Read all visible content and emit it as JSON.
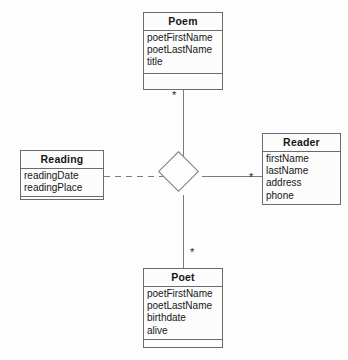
{
  "diagram": {
    "type": "uml-class-diagram",
    "classes": [
      {
        "id": "poem",
        "name": "Poem",
        "attributes": [
          "poetFirstName",
          "poetLastName",
          "title"
        ],
        "operations": []
      },
      {
        "id": "reading",
        "name": "Reading",
        "attributes": [
          "readingDate",
          "readingPlace"
        ],
        "operations": []
      },
      {
        "id": "reader",
        "name": "Reader",
        "attributes": [
          "firstName",
          "lastName",
          "address",
          "phone"
        ],
        "operations": []
      },
      {
        "id": "poet",
        "name": "Poet",
        "attributes": [
          "poetFirstName",
          "poetLastName",
          "birthdate",
          "alive"
        ],
        "operations": []
      }
    ],
    "association": {
      "name": "",
      "shape": "diamond",
      "ends": [
        {
          "target": "poem",
          "multiplicity": "*",
          "line": "solid"
        },
        {
          "target": "reader",
          "multiplicity": "*",
          "line": "solid"
        },
        {
          "target": "poet",
          "multiplicity": "*",
          "line": "solid"
        },
        {
          "target": "reading",
          "multiplicity": "",
          "line": "dashed"
        }
      ]
    },
    "colors": {
      "background": "#fdfdfd",
      "box_fill": "#fcfcfc",
      "border": "#6b6b6b",
      "line": "#7a7a7a",
      "text": "#161616"
    }
  }
}
